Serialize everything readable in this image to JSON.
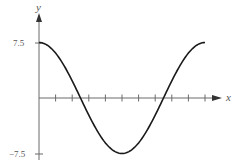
{
  "chart_data": {
    "type": "line",
    "title": "",
    "xlabel": "x",
    "ylabel": "y",
    "function": "y = 7.5 cos(2*pi*x/10)",
    "ytick_labels": [
      "7.5",
      "-7.5"
    ],
    "yticks": [
      7.5,
      -7.5
    ],
    "xticks": [
      1,
      2,
      3,
      4,
      5,
      6,
      7,
      8,
      9,
      10
    ],
    "xtick_labels": [],
    "xlim": [
      0,
      11
    ],
    "ylim": [
      -8,
      8
    ],
    "grid": false,
    "legend": null,
    "series": [
      {
        "name": "curve",
        "x": [
          0,
          1,
          2,
          2.5,
          3,
          4,
          5,
          6,
          7,
          7.5,
          8,
          9,
          10
        ],
        "y": [
          7.5,
          6.07,
          2.32,
          0,
          -2.32,
          -6.07,
          -7.5,
          -6.07,
          -2.32,
          0,
          2.32,
          6.07,
          7.5
        ]
      }
    ],
    "colors": {
      "axis": "#6b6b6b",
      "curve": "#1a1a1a",
      "text": "#555555"
    }
  },
  "labels": {
    "x_axis": "x",
    "y_axis": "y",
    "y_max": "7.5",
    "y_min": "−7.5"
  }
}
